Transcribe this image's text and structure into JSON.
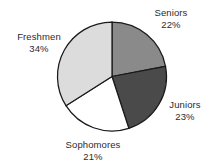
{
  "chart_data": {
    "type": "pie",
    "title": "",
    "subtitle": "",
    "xlabel": "",
    "ylabel": "",
    "legend_position": "none",
    "grid": false,
    "start_angle_deg": 0,
    "direction": "clockwise",
    "units": "percent",
    "total": 100,
    "categories": [
      "Seniors",
      "Juniors",
      "Sophomores",
      "Freshmen"
    ],
    "values": [
      22,
      23,
      21,
      34
    ],
    "slices": [
      {
        "id": "seniors",
        "name": "Seniors",
        "value": 22,
        "value_label": "22%",
        "color": "#8a8a8a",
        "start_deg": 0,
        "end_deg": 79.2
      },
      {
        "id": "juniors",
        "name": "Juniors",
        "value": 23,
        "value_label": "23%",
        "color": "#4a4a4a",
        "start_deg": 79.2,
        "end_deg": 162.0
      },
      {
        "id": "sophomores",
        "name": "Sophomores",
        "value": 21,
        "value_label": "21%",
        "color": "#ffffff",
        "start_deg": 162.0,
        "end_deg": 237.6
      },
      {
        "id": "freshmen",
        "name": "Freshmen",
        "value": 34,
        "value_label": "34%",
        "color": "#dcdcdc",
        "start_deg": 237.6,
        "end_deg": 360.0
      }
    ]
  },
  "labels": {
    "seniors": {
      "name": "Seniors",
      "pct": "22%"
    },
    "juniors": {
      "name": "Juniors",
      "pct": "23%"
    },
    "sophomores": {
      "name": "Sophomores",
      "pct": "21%"
    },
    "freshmen": {
      "name": "Freshmen",
      "pct": "34%"
    }
  },
  "style": {
    "background": "#ffffff",
    "outline_color": "#1a1a1a",
    "text_color": "#2b2b2b"
  }
}
